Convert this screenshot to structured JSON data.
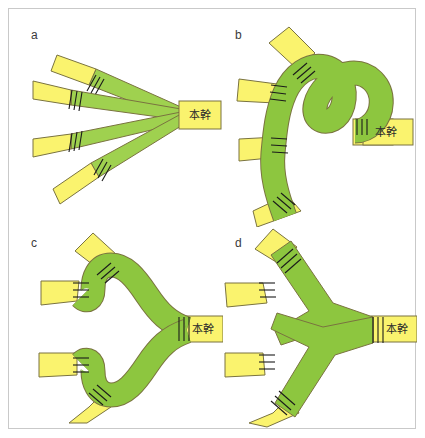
{
  "figure": {
    "background_color": "#ffffff",
    "frame_color": "#c9c9c9",
    "colors": {
      "branch_green": "#8dc63f",
      "branch_green_light": "#9fd14f",
      "branch_yellow": "#faf36e",
      "outline": "#7a7340",
      "tick_mark": "#1a1a1a",
      "label_text": "#3a3a3a"
    },
    "panels": [
      {
        "id": "a",
        "label": "a",
        "trunk_label": "本幹",
        "pattern": "radiating-fan",
        "branch_count": 4,
        "description": "Four straight tapered branches radiating in a fan from a single trunk on the right."
      },
      {
        "id": "b",
        "label": "b",
        "trunk_label": "本幹",
        "pattern": "serpentine-curve",
        "branch_count": 4,
        "description": "A single smoothly meandering serpentine band with four branches budding off the outer (left) side."
      },
      {
        "id": "c",
        "label": "c",
        "trunk_label": "本幹",
        "pattern": "bifurcating-smooth",
        "branch_count": 4,
        "description": "Trunk bifurcates into two symmetric smooth curving arms, each ending in two branches."
      },
      {
        "id": "d",
        "label": "d",
        "trunk_label": "本幹",
        "pattern": "bifurcating-zigzag",
        "branch_count": 4,
        "description": "Trunk bifurcates into two sharp zigzag arms, each ending in two angular branches."
      }
    ]
  }
}
